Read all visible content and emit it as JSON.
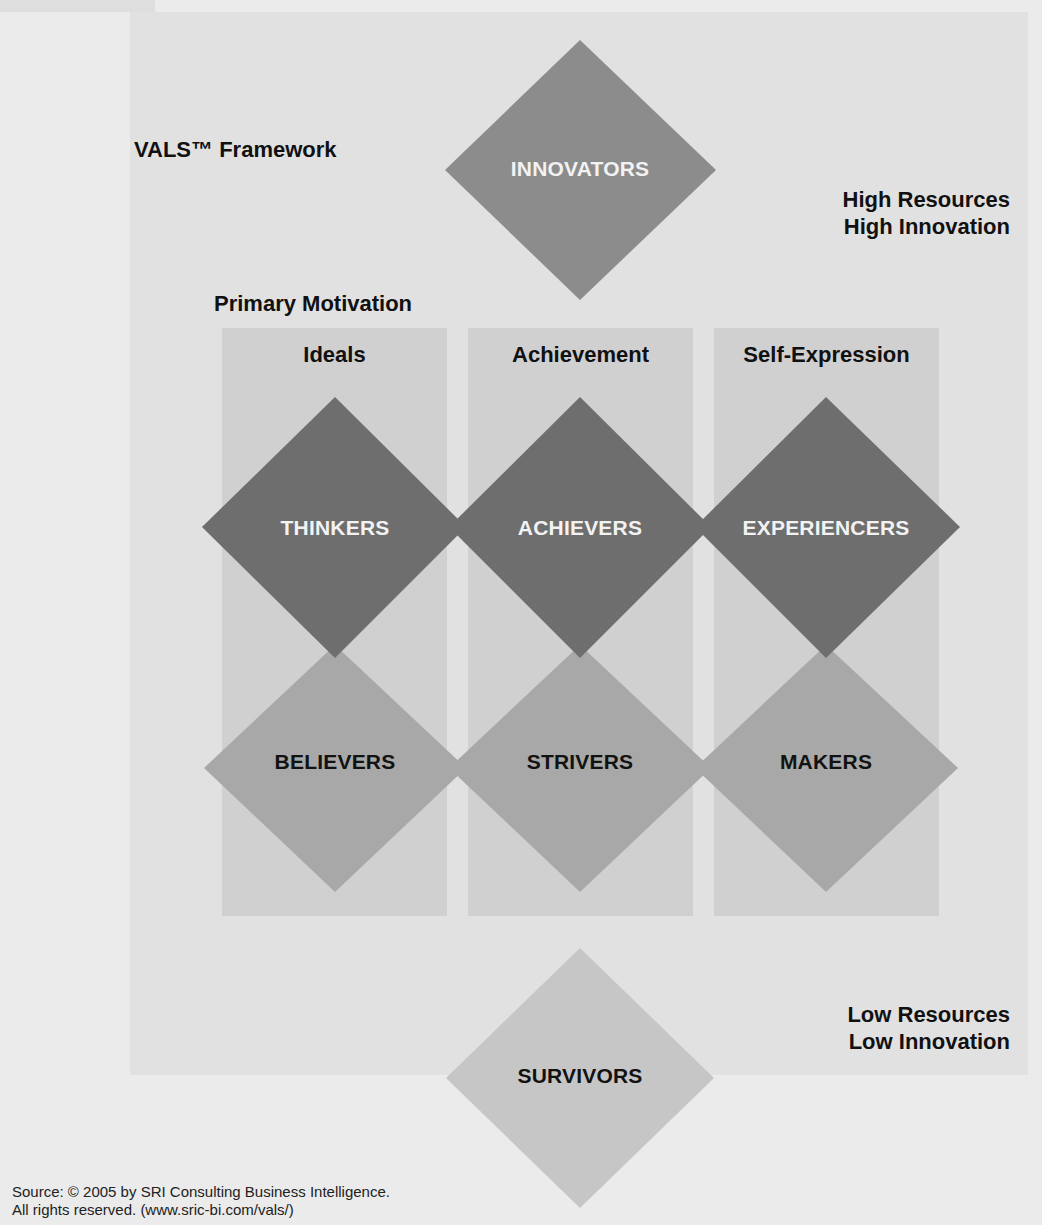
{
  "title": "VALS™ Framework",
  "axis": {
    "top_label": [
      "High Resources",
      "High Innovation"
    ],
    "bottom_label": [
      "Low Resources",
      "Low Innovation"
    ],
    "primary_motivation_label": "Primary Motivation"
  },
  "columns": [
    {
      "label": "Ideals"
    },
    {
      "label": "Achievement"
    },
    {
      "label": "Self-Expression"
    }
  ],
  "segments": {
    "top": {
      "label": "INNOVATORS",
      "color": "#8c8c8c"
    },
    "upper_row": [
      {
        "label": "THINKERS",
        "color": "#6e6e6e"
      },
      {
        "label": "ACHIEVERS",
        "color": "#6e6e6e"
      },
      {
        "label": "EXPERIENCERS",
        "color": "#6e6e6e"
      }
    ],
    "lower_row": [
      {
        "label": "BELIEVERS",
        "color": "#a8a8a8"
      },
      {
        "label": "STRIVERS",
        "color": "#a8a8a8"
      },
      {
        "label": "MAKERS",
        "color": "#a8a8a8"
      }
    ],
    "bottom": {
      "label": "SURVIVORS",
      "color": "#c6c6c6"
    }
  },
  "source": {
    "line1": "Source: © 2005 by SRI Consulting Business Intelligence.",
    "line2": "All rights reserved. (www.sric-bi.com/vals/)"
  }
}
